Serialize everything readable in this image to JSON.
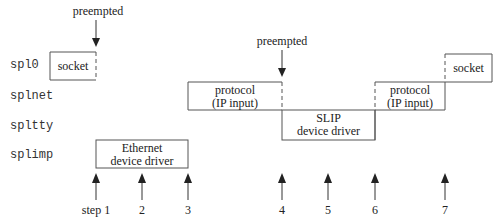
{
  "levels": [
    {
      "name": "spl0"
    },
    {
      "name": "splnet"
    },
    {
      "name": "spltty"
    },
    {
      "name": "splimp"
    }
  ],
  "boxes": [
    {
      "id": "socket-1",
      "line1": "socket",
      "line2": "",
      "level": "spl0"
    },
    {
      "id": "protocol-1",
      "line1": "protocol",
      "line2": "(IP input)",
      "level": "splnet"
    },
    {
      "id": "ethernet",
      "line1": "Ethernet",
      "line2": "device driver",
      "level": "splimp"
    },
    {
      "id": "slip",
      "line1": "SLIP",
      "line2": "device driver",
      "level": "spltty"
    },
    {
      "id": "protocol-2",
      "line1": "protocol",
      "line2": "(IP input)",
      "level": "splnet"
    },
    {
      "id": "socket-2",
      "line1": "socket",
      "line2": "",
      "level": "spl0"
    }
  ],
  "annotations": [
    {
      "text": "preempted",
      "at_step": "1"
    },
    {
      "text": "preempted",
      "at_step": "4"
    }
  ],
  "steps": [
    "step 1",
    "2",
    "3",
    "4",
    "5",
    "6",
    "7"
  ]
}
